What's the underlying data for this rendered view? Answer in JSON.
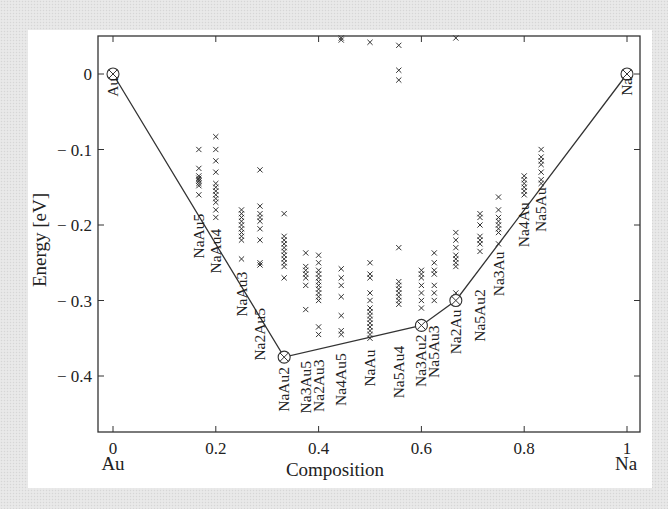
{
  "chart_data": {
    "type": "scatter",
    "title": "",
    "xlabel": "Composition",
    "ylabel": "Energy [eV]",
    "xlim": [
      -0.03,
      1.03
    ],
    "ylim": [
      -0.475,
      0.05
    ],
    "x_ticks": [
      0,
      0.2,
      0.4,
      0.6,
      0.8,
      1
    ],
    "x_tick_labels": [
      "0",
      "0.2",
      "0.4",
      "0.6",
      "0.8",
      "1"
    ],
    "x_end_labels": {
      "left": "Au",
      "right": "Na"
    },
    "y_ticks": [
      0,
      -0.1,
      -0.2,
      -0.3,
      -0.4
    ],
    "y_tick_labels": [
      "0",
      "− 0.1",
      "− 0.2",
      "− 0.3",
      "− 0.4"
    ],
    "grid": false,
    "legend": null,
    "convex_hull": {
      "name": "Ground-state hull",
      "points": [
        {
          "label": "Au",
          "x": 0.0,
          "y": 0.0
        },
        {
          "label": "NaAu2",
          "x": 0.333,
          "y": -0.375
        },
        {
          "label": "Na3Au2",
          "x": 0.6,
          "y": -0.333
        },
        {
          "label": "Na2Au",
          "x": 0.667,
          "y": -0.3
        },
        {
          "label": "Na",
          "x": 1.0,
          "y": 0.0
        }
      ]
    },
    "structures": [
      {
        "x": 0.167,
        "energies": [
          -0.1,
          -0.125,
          -0.135,
          -0.138,
          -0.14,
          -0.142,
          -0.145,
          -0.148,
          -0.16
        ]
      },
      {
        "x": 0.2,
        "energies": [
          -0.083,
          -0.1,
          -0.115,
          -0.13,
          -0.145,
          -0.15,
          -0.155,
          -0.16,
          -0.165,
          -0.17,
          -0.18,
          -0.19
        ]
      },
      {
        "x": 0.25,
        "energies": [
          -0.18,
          -0.185,
          -0.19,
          -0.195,
          -0.2,
          -0.205,
          -0.21,
          -0.215,
          -0.22,
          -0.245
        ]
      },
      {
        "x": 0.286,
        "energies": [
          -0.127,
          -0.175,
          -0.185,
          -0.19,
          -0.195,
          -0.205,
          -0.22,
          -0.25,
          -0.253
        ]
      },
      {
        "x": 0.333,
        "energies": [
          -0.185,
          -0.215,
          -0.22,
          -0.225,
          -0.23,
          -0.235,
          -0.24,
          -0.245,
          -0.25,
          -0.255,
          -0.27
        ]
      },
      {
        "x": 0.375,
        "energies": [
          -0.237,
          -0.255,
          -0.26,
          -0.265,
          -0.27,
          -0.28,
          -0.312
        ]
      },
      {
        "x": 0.4,
        "energies": [
          -0.24,
          -0.25,
          -0.26,
          -0.265,
          -0.27,
          -0.275,
          -0.28,
          -0.285,
          -0.29,
          -0.295,
          -0.3,
          -0.335,
          -0.345
        ]
      },
      {
        "x": 0.444,
        "energies": [
          -0.258,
          -0.27,
          -0.28,
          -0.295,
          -0.32,
          -0.34,
          -0.345,
          0.045,
          0.05
        ]
      },
      {
        "x": 0.5,
        "energies": [
          -0.25,
          -0.265,
          -0.27,
          -0.29,
          -0.3,
          -0.31,
          -0.315,
          -0.32,
          -0.325,
          -0.33,
          -0.335,
          -0.34,
          -0.345,
          -0.35,
          0.042
        ]
      },
      {
        "x": 0.556,
        "energies": [
          -0.23,
          -0.275,
          -0.28,
          -0.285,
          -0.29,
          -0.295,
          -0.3,
          -0.305,
          0.005,
          -0.008,
          0.038
        ]
      },
      {
        "x": 0.6,
        "energies": [
          -0.26,
          -0.265,
          -0.27,
          -0.28,
          -0.29,
          -0.3,
          -0.31
        ]
      },
      {
        "x": 0.625,
        "energies": [
          -0.237,
          -0.25,
          -0.26,
          -0.265,
          -0.28,
          -0.29,
          -0.3
        ]
      },
      {
        "x": 0.667,
        "energies": [
          -0.21,
          -0.22,
          -0.23,
          -0.24,
          -0.245,
          -0.25,
          -0.255,
          -0.29,
          -0.295,
          0.052
        ]
      },
      {
        "x": 0.714,
        "energies": [
          -0.185,
          -0.19,
          -0.2,
          -0.215,
          -0.22,
          -0.225,
          -0.235
        ]
      },
      {
        "x": 0.75,
        "energies": [
          -0.163,
          -0.18,
          -0.19,
          -0.195,
          -0.2,
          -0.205,
          -0.21,
          -0.225
        ]
      },
      {
        "x": 0.8,
        "energies": [
          -0.135,
          -0.14,
          -0.145,
          -0.15,
          -0.155,
          -0.16
        ]
      },
      {
        "x": 0.833,
        "energies": [
          -0.1,
          -0.11,
          -0.115,
          -0.12,
          -0.13,
          -0.14,
          -0.145
        ]
      }
    ],
    "phase_labels": [
      {
        "text": "Au",
        "x": 0.0,
        "y_top": -0.005
      },
      {
        "text": "NaAu5",
        "x": 0.167,
        "y_top": -0.185
      },
      {
        "text": "NaAu4",
        "x": 0.2,
        "y_top": -0.205
      },
      {
        "text": "NaAu3",
        "x": 0.25,
        "y_top": -0.262
      },
      {
        "text": "Na2Au5",
        "x": 0.286,
        "y_top": -0.31
      },
      {
        "text": "NaAu2",
        "x": 0.333,
        "y_top": -0.388
      },
      {
        "text": "Na3Au5",
        "x": 0.375,
        "y_top": -0.38
      },
      {
        "text": "Na2Au3",
        "x": 0.4,
        "y_top": -0.378
      },
      {
        "text": "Na4Au5",
        "x": 0.444,
        "y_top": -0.37
      },
      {
        "text": "NaAu",
        "x": 0.5,
        "y_top": -0.365
      },
      {
        "text": "Na5Au4",
        "x": 0.556,
        "y_top": -0.36
      },
      {
        "text": "Na3Au2",
        "x": 0.6,
        "y_top": -0.345
      },
      {
        "text": "Na5Au3",
        "x": 0.625,
        "y_top": -0.333
      },
      {
        "text": "Na2Au",
        "x": 0.667,
        "y_top": -0.312
      },
      {
        "text": "Na5Au2",
        "x": 0.714,
        "y_top": -0.285
      },
      {
        "text": "Na3Au",
        "x": 0.75,
        "y_top": -0.235
      },
      {
        "text": "Na4Au",
        "x": 0.8,
        "y_top": -0.17
      },
      {
        "text": "Na5Au",
        "x": 0.833,
        "y_top": -0.15
      },
      {
        "text": "Na",
        "x": 1.0,
        "y_top": -0.005
      }
    ],
    "colors": {
      "line": "#333333",
      "marker": "#333333",
      "text": "#222222",
      "frame": "#333333"
    }
  }
}
